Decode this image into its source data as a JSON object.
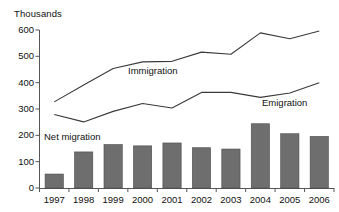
{
  "chart_data": {
    "type": "bar",
    "title": "",
    "subtitle": "",
    "ylabel": "Thousands",
    "xlabel": "",
    "ylim": [
      0,
      600
    ],
    "yticks": [
      0,
      100,
      200,
      300,
      400,
      500,
      600
    ],
    "grid": false,
    "legend_position": "inline-annotations",
    "categories": [
      "1997",
      "1998",
      "1999",
      "2000",
      "2001",
      "2002",
      "2003",
      "2004",
      "2005",
      "2006"
    ],
    "series": [
      {
        "name": "Immigration",
        "type": "line",
        "values": [
          327,
          391,
          454,
          479,
          481,
          516,
          508,
          589,
          567,
          596
        ]
      },
      {
        "name": "Emigration",
        "type": "line",
        "values": [
          279,
          251,
          291,
          321,
          304,
          363,
          363,
          344,
          361,
          400
        ]
      },
      {
        "name": "Net migration",
        "type": "bar",
        "values": [
          53,
          137,
          165,
          160,
          171,
          153,
          148,
          244,
          206,
          196
        ]
      }
    ],
    "annotations": [
      {
        "text": "Immigration",
        "series": "Immigration"
      },
      {
        "text": "Emigration",
        "series": "Emigration"
      },
      {
        "text": "Net migration",
        "series": "Net migration"
      }
    ],
    "colors": {
      "bar_fill": "#6e6e6e",
      "bar_stroke": "#4a4a4a",
      "line": "#3a3a3a",
      "axis": "#555555",
      "text": "#111111",
      "background": "#ffffff"
    }
  }
}
